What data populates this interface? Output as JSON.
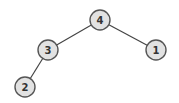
{
  "diagram": {
    "type": "binary-tree",
    "colors": {
      "node_fill": "#e2e2e2",
      "node_stroke": "#555555",
      "edge": "#444444",
      "label": "#333333"
    },
    "nodes": [
      {
        "id": "n4",
        "label": "4",
        "x": 100,
        "y": 20,
        "r": 10
      },
      {
        "id": "n3",
        "label": "3",
        "x": 48,
        "y": 50,
        "r": 10
      },
      {
        "id": "n1",
        "label": "1",
        "x": 156,
        "y": 50,
        "r": 10
      },
      {
        "id": "n2",
        "label": "2",
        "x": 25,
        "y": 87,
        "r": 10
      }
    ],
    "edges": [
      {
        "from": "4",
        "to": "3"
      },
      {
        "from": "4",
        "to": "1"
      },
      {
        "from": "3",
        "to": "2"
      }
    ]
  }
}
